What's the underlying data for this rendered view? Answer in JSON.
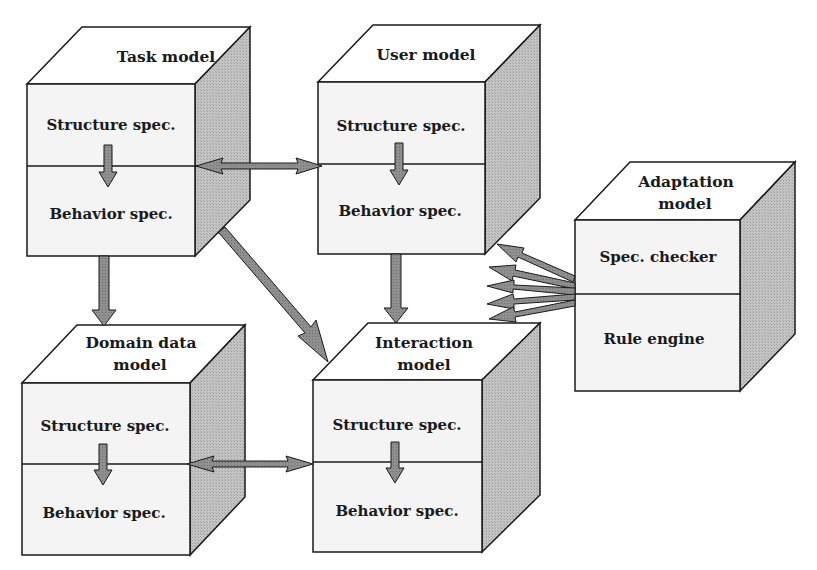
{
  "colors": {
    "face": "#f4f4f4",
    "side": "#b9b9b9",
    "arrow": "#8a8a8a",
    "stroke": "#1a1a1a"
  },
  "models": {
    "task": {
      "title_lines": [
        "Task model"
      ],
      "sections": [
        "Structure spec.",
        "Behavior spec."
      ]
    },
    "user": {
      "title_lines": [
        "User model"
      ],
      "sections": [
        "Structure spec.",
        "Behavior spec."
      ]
    },
    "adaptation": {
      "title_lines": [
        "Adaptation",
        "model"
      ],
      "sections": [
        "Spec. checker",
        "Rule engine"
      ]
    },
    "domain": {
      "title_lines": [
        "Domain data",
        "model"
      ],
      "sections": [
        "Structure spec.",
        "Behavior spec."
      ]
    },
    "interaction": {
      "title_lines": [
        "Interaction",
        "model"
      ],
      "sections": [
        "Structure spec.",
        "Behavior spec."
      ]
    }
  },
  "connections": [
    {
      "from": "task",
      "to": "user",
      "type": "bidirectional"
    },
    {
      "from": "task",
      "to": "domain",
      "type": "directed"
    },
    {
      "from": "task",
      "to": "interaction",
      "type": "directed"
    },
    {
      "from": "user",
      "to": "interaction",
      "type": "directed"
    },
    {
      "from": "domain",
      "to": "interaction",
      "type": "bidirectional"
    },
    {
      "from": "adaptation",
      "to": "user",
      "type": "directed"
    },
    {
      "from": "adaptation",
      "to": "user",
      "type": "directed"
    },
    {
      "from": "adaptation",
      "to": "interaction",
      "type": "directed"
    },
    {
      "from": "adaptation",
      "to": "interaction",
      "type": "directed"
    },
    {
      "from": "adaptation",
      "to": "interaction",
      "type": "directed"
    }
  ]
}
